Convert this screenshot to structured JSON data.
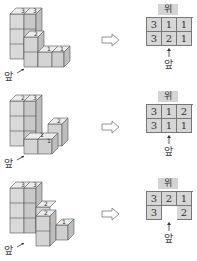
{
  "rows": [
    {
      "top_label": "위",
      "front_label": "앞",
      "grid": [
        [
          "3",
          "1",
          "1"
        ],
        [
          "3",
          "2",
          "1"
        ]
      ],
      "cube_labels": [
        "3",
        "3",
        "2",
        "1",
        "1"
      ]
    },
    {
      "top_label": "위",
      "front_label": "앞",
      "grid": [
        [
          "3",
          "1",
          "2"
        ],
        [
          "3",
          "1",
          "1"
        ]
      ],
      "cube_labels": [
        "2",
        "3",
        "2",
        "1",
        "1"
      ]
    },
    {
      "top_label": "위",
      "front_label": "앞",
      "grid": [
        [
          "3",
          "2",
          "1"
        ],
        [
          "3",
          "",
          "2"
        ]
      ],
      "cube_labels": [
        "3",
        "3",
        "2",
        "2",
        "1"
      ]
    }
  ],
  "colors": {
    "cube_face_light": "#e6e6e6",
    "cube_face_mid": "#cfcfcf",
    "cube_face_dark": "#bdbdbd",
    "grid_fill": "#d6d6d6",
    "stroke": "#555555"
  }
}
